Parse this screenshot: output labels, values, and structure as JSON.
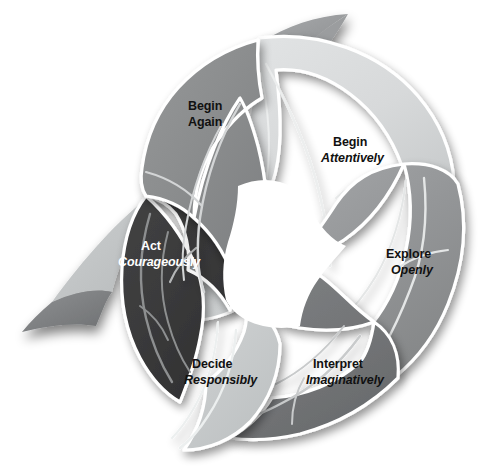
{
  "diagram": {
    "type": "circular-cycle",
    "shape": "six overlapping leaf petals forming a ring with an open white center",
    "background_color": "#ffffff",
    "petal_outline_color": "#ffffff",
    "vein_color": "#e8eaea",
    "segment_count": 6,
    "segments": [
      {
        "id": "begin-attentively",
        "line1": "Begin",
        "line2": "Attentively",
        "line2_style": "bold-italic",
        "fill": "#d7d9da",
        "text_color": "#111111",
        "position": "top-right",
        "order": 1
      },
      {
        "id": "explore-openly",
        "line1": "Explore",
        "line2": "Openly",
        "line2_style": "bold-italic",
        "fill": "#949698",
        "text_color": "#111111",
        "position": "right",
        "order": 2
      },
      {
        "id": "interpret-imaginatively",
        "line1": "Interpret",
        "line2": "Imaginatively",
        "line2_style": "bold-italic",
        "fill": "#727476",
        "text_color": "#111111",
        "position": "bottom-right",
        "order": 3
      },
      {
        "id": "decide-responsibly",
        "line1": "Decide",
        "line2": "Responsibly",
        "line2_style": "bold-italic",
        "fill": "#c9cccd",
        "text_color": "#111111",
        "position": "bottom-left",
        "order": 4
      },
      {
        "id": "act-courageously",
        "line1": "Act",
        "line2": "Courageously",
        "line2_style": "bold-italic",
        "fill": "#3a3a3b",
        "text_color": "#ffffff",
        "position": "left",
        "order": 5
      },
      {
        "id": "begin-again",
        "line1": "Begin",
        "line2": "Again",
        "line2_style": "bold",
        "fill": "#8a8c8d",
        "text_color": "#111111",
        "position": "top-left",
        "order": 6
      }
    ],
    "accents": {
      "tail_light_fill": "#c4c7c8",
      "tail_dark_fill": "#86888a",
      "top_tip_fill": "#9a9c9e",
      "top_tip_shadow": "#a9abad"
    }
  }
}
